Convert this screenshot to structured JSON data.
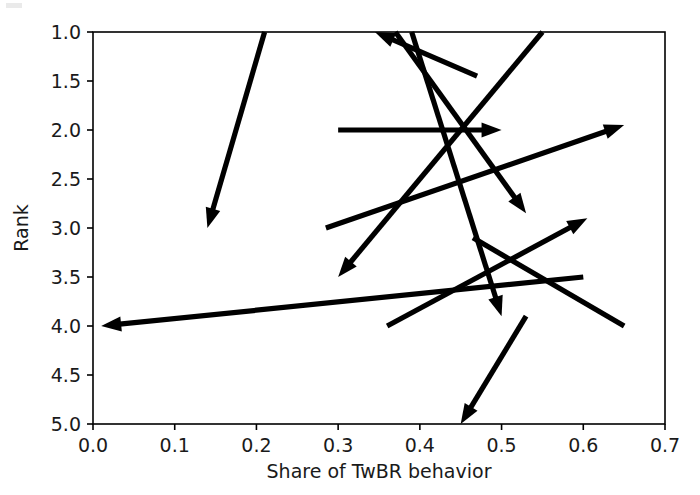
{
  "chart_data": {
    "type": "line",
    "title": "",
    "xlabel": "Share of TwBR behavior",
    "ylabel": "Rank",
    "xlim": [
      0.0,
      0.7
    ],
    "ylim": [
      5.0,
      1.0
    ],
    "y_inverted": true,
    "grid": false,
    "legend": null,
    "xticks": [
      0.0,
      0.1,
      0.2,
      0.3,
      0.4,
      0.5,
      0.6,
      0.7
    ],
    "xticklabels": [
      "0.0",
      "0.1",
      "0.2",
      "0.3",
      "0.4",
      "0.5",
      "0.6",
      "0.7"
    ],
    "yticks": [
      1.0,
      1.5,
      2.0,
      2.5,
      3.0,
      3.5,
      4.0,
      4.5,
      5.0
    ],
    "yticklabels": [
      "1.0",
      "1.5",
      "2.0",
      "2.5",
      "3.0",
      "3.5",
      "4.0",
      "4.5",
      "5.0"
    ],
    "marker": "arrow",
    "series": [
      {
        "name": "arrow-1",
        "x": [
          0.21,
          0.14
        ],
        "y": [
          1.0,
          3.0
        ],
        "arrowhead": "end"
      },
      {
        "name": "arrow-2",
        "x": [
          0.55,
          0.3
        ],
        "y": [
          1.0,
          3.5
        ],
        "arrowhead": "end"
      },
      {
        "name": "arrow-3",
        "x": [
          0.39,
          0.5
        ],
        "y": [
          1.0,
          3.9
        ],
        "arrowhead": "end"
      },
      {
        "name": "arrow-4",
        "x": [
          0.37,
          0.53
        ],
        "y": [
          1.0,
          2.85
        ],
        "arrowhead": "end"
      },
      {
        "name": "arrow-5",
        "x": [
          0.47,
          0.345
        ],
        "y": [
          1.45,
          1.0
        ],
        "arrowhead": "end"
      },
      {
        "name": "arrow-6",
        "x": [
          0.3,
          0.5
        ],
        "y": [
          2.0,
          2.0
        ],
        "arrowhead": "end"
      },
      {
        "name": "arrow-7",
        "x": [
          0.285,
          0.65
        ],
        "y": [
          3.0,
          1.95
        ],
        "arrowhead": "end"
      },
      {
        "name": "arrow-8",
        "x": [
          0.36,
          0.605
        ],
        "y": [
          4.0,
          2.9
        ],
        "arrowhead": "end"
      },
      {
        "name": "arrow-9",
        "x": [
          0.6,
          0.01
        ],
        "y": [
          3.5,
          4.0
        ],
        "arrowhead": "end"
      },
      {
        "name": "arrow-10",
        "x": [
          0.53,
          0.45
        ],
        "y": [
          3.9,
          5.0
        ],
        "arrowhead": "end"
      },
      {
        "name": "line-11",
        "x": [
          0.465,
          0.65
        ],
        "y": [
          3.1,
          4.0
        ],
        "arrowhead": "none"
      }
    ]
  },
  "axes": {
    "x_label": "Share of TwBR behavior",
    "y_label": "Rank"
  }
}
